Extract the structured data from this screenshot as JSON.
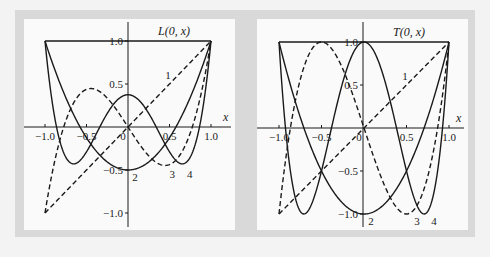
{
  "colors": {
    "background": "#f3f3f3",
    "frame": "#d9d9d9",
    "panel": "#fafafa",
    "ink": "#1a1a1a"
  },
  "chart_data": [
    {
      "type": "line",
      "title": "L(0, x)",
      "xlabel": "x",
      "ylabel": "",
      "xlim": [
        -1.0,
        1.0
      ],
      "ylim": [
        -1.0,
        1.0
      ],
      "xticks": [
        "-1.0",
        "-0.5",
        "0",
        "0.5",
        "1.0"
      ],
      "yticks": [
        "-1.0",
        "-0.5",
        "0.5",
        "1.0"
      ],
      "grid": false,
      "legend": "inline curve labels",
      "series": [
        {
          "name": "0",
          "style": "solid",
          "formula": "1",
          "label": ""
        },
        {
          "name": "1",
          "style": "dashed",
          "formula": "x",
          "label": "1"
        },
        {
          "name": "2",
          "style": "solid",
          "formula": "(3x^2-1)/2",
          "label": "2"
        },
        {
          "name": "3",
          "style": "dashed",
          "formula": "(5x^3-3x)/2",
          "label": "3"
        },
        {
          "name": "4",
          "style": "solid",
          "formula": "(35x^4-30x^2+3)/8",
          "label": "4"
        }
      ],
      "curve_labels": [
        {
          "text": "1",
          "x": 0.45,
          "y": 0.6
        },
        {
          "text": "2",
          "x": 0.05,
          "y": -0.58
        },
        {
          "text": "3",
          "x": 0.5,
          "y": -0.55
        },
        {
          "text": "4",
          "x": 0.71,
          "y": -0.55
        }
      ],
      "frame": {
        "left_px": 45,
        "right_px": 211,
        "top_px": 41,
        "bottom_px": 213,
        "yaxis_px": 128,
        "xaxis_px": 127
      }
    },
    {
      "type": "line",
      "title": "T(0, x)",
      "xlabel": "x",
      "ylabel": "",
      "xlim": [
        -1.0,
        1.0
      ],
      "ylim": [
        -1.0,
        1.0
      ],
      "xticks": [
        "-1.0",
        "-0.5",
        "0",
        "0.5",
        "1.0"
      ],
      "yticks": [
        "-1.0",
        "-0.5",
        "0.5",
        "1.0"
      ],
      "grid": false,
      "legend": "inline curve labels",
      "series": [
        {
          "name": "0",
          "style": "solid",
          "formula": "1",
          "label": ""
        },
        {
          "name": "1",
          "style": "dashed",
          "formula": "x",
          "label": "1"
        },
        {
          "name": "2",
          "style": "solid",
          "formula": "2x^2-1",
          "label": "2"
        },
        {
          "name": "3",
          "style": "dashed",
          "formula": "4x^3-3x",
          "label": "3"
        },
        {
          "name": "4",
          "style": "solid",
          "formula": "8x^4-8x^2+1",
          "label": "4"
        }
      ],
      "curve_labels": [
        {
          "text": "1",
          "x": 0.45,
          "y": 0.6
        },
        {
          "text": "2",
          "x": 0.05,
          "y": -1.08
        },
        {
          "text": "3",
          "x": 0.59,
          "y": -1.08
        },
        {
          "text": "4",
          "x": 0.79,
          "y": -1.08
        }
      ],
      "frame": {
        "left_px": 279,
        "right_px": 449,
        "top_px": 42,
        "bottom_px": 214,
        "yaxis_px": 363,
        "xaxis_px": 128
      }
    }
  ]
}
